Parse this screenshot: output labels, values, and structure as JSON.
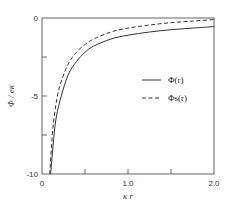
{
  "chart_data": {
    "type": "line",
    "title": "",
    "xlabel": "κ r",
    "ylabel": "Φ / eκ",
    "xlim": [
      0,
      2.0
    ],
    "ylim": [
      -10,
      0
    ],
    "grid": false,
    "legend_position": "center-right",
    "x_ticks": [
      0,
      0.5,
      1.0,
      1.5,
      2.0
    ],
    "x_tick_labels": [
      "0",
      "",
      "1.0",
      "",
      "2.0"
    ],
    "y_ticks": [
      0,
      -2.5,
      -5,
      -7.5,
      -10
    ],
    "y_tick_labels": [
      "0",
      "",
      "-5",
      "",
      "-10"
    ],
    "series": [
      {
        "name": "Φ(r)",
        "style": "solid",
        "x": [
          0.1,
          0.15,
          0.2,
          0.3,
          0.4,
          0.5,
          0.6,
          0.8,
          1.0,
          1.25,
          1.5,
          1.75,
          2.0
        ],
        "y": [
          -10.0,
          -7.0,
          -5.5,
          -3.7,
          -2.8,
          -2.2,
          -1.8,
          -1.35,
          -1.1,
          -0.9,
          -0.75,
          -0.65,
          -0.55
        ]
      },
      {
        "name": "Φs(r)",
        "style": "dashed",
        "x": [
          0.09,
          0.12,
          0.15,
          0.2,
          0.3,
          0.4,
          0.5,
          0.6,
          0.8,
          1.0,
          1.25,
          1.5,
          1.75,
          2.0
        ],
        "y": [
          -10.0,
          -7.5,
          -6.0,
          -4.5,
          -3.0,
          -2.2,
          -1.7,
          -1.35,
          -0.9,
          -0.65,
          -0.45,
          -0.3,
          -0.2,
          -0.1
        ]
      }
    ]
  },
  "axes": {
    "x_label": "κ r",
    "y_label": "Φ / eκ",
    "x_tick_text": {
      "t0": "0",
      "t1": "1.0",
      "t2": "2.0"
    },
    "y_tick_text": {
      "t0": "0",
      "t1": "-5",
      "t2": "-10"
    }
  },
  "legend": {
    "items": [
      {
        "label": "Φ(r)",
        "style": "solid"
      },
      {
        "label": "Φs(r)",
        "style": "dashed"
      }
    ]
  },
  "colors": {
    "axis": "#555555",
    "line": "#333333",
    "background": "#ffffff"
  }
}
